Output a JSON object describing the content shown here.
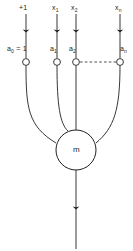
{
  "diagram": {
    "stroke_color": "#231f20",
    "background_color": "#ffffff",
    "inputs": [
      {
        "id": "bias",
        "input_label": "+1",
        "weight_label": "a",
        "weight_sub": "0",
        "weight_suffix": " = 1"
      },
      {
        "id": "x1",
        "input_label": "x",
        "input_sub": "1",
        "weight_label": "a",
        "weight_sub": "1",
        "weight_suffix": ""
      },
      {
        "id": "x2",
        "input_label": "x",
        "input_sub": "2",
        "weight_label": "a",
        "weight_sub": "2",
        "weight_suffix": ""
      },
      {
        "id": "xn",
        "input_label": "x",
        "input_sub": "n",
        "weight_label": "a",
        "weight_sub": "n",
        "weight_suffix": ""
      }
    ],
    "input_labels_text": {
      "bias": "+1",
      "x1": "x1",
      "x2": "x2",
      "xn": "xn"
    },
    "weight_labels_text": {
      "bias": "a0 = 1",
      "x1": "a1",
      "x2": "a2",
      "xn": "an"
    },
    "node": {
      "letter": "m",
      "shape": "circle"
    },
    "ellipsis": {
      "style": "dashed-line",
      "meaning": "continuation between a2 and an"
    },
    "output": {
      "label": "",
      "arrow": "down"
    }
  }
}
